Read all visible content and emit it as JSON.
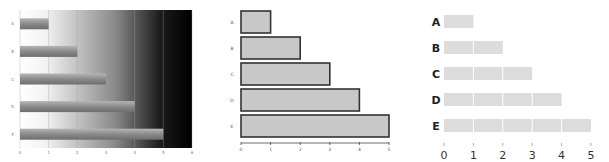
{
  "chart_data": [
    {
      "type": "bar",
      "orientation": "horizontal",
      "style": "gradient-background",
      "categories": [
        "A",
        "B",
        "C",
        "D",
        "E"
      ],
      "values": [
        1,
        2,
        3,
        4,
        5
      ],
      "title": "",
      "xlabel": "",
      "ylabel": "",
      "xlim": [
        0,
        6
      ],
      "xticks": [
        "0",
        "1",
        "2",
        "3",
        "4",
        "5",
        "6"
      ],
      "grid": true,
      "colors": {
        "background_start": "#ffffff",
        "background_end": "#000000",
        "bar": "#8a8a8a"
      }
    },
    {
      "type": "bar",
      "orientation": "horizontal",
      "style": "outlined",
      "categories": [
        "A",
        "B",
        "C",
        "D",
        "E"
      ],
      "values": [
        1,
        2,
        3,
        4,
        5
      ],
      "title": "",
      "xlabel": "",
      "ylabel": "",
      "xlim": [
        0,
        5
      ],
      "xticks": [
        "0",
        "1",
        "2",
        "3",
        "4",
        "5"
      ],
      "grid": false,
      "colors": {
        "bar_fill": "#c8c8c8",
        "bar_stroke": "#333333"
      }
    },
    {
      "type": "bar",
      "orientation": "horizontal",
      "style": "segmented-flat",
      "categories": [
        "A",
        "B",
        "C",
        "D",
        "E"
      ],
      "values": [
        1,
        2,
        3,
        4,
        5
      ],
      "title": "",
      "xlabel": "",
      "ylabel": "",
      "xlim": [
        0,
        5
      ],
      "xticks": [
        "0",
        "1",
        "2",
        "3",
        "4",
        "5"
      ],
      "grid": false,
      "colors": {
        "bar_fill": "#dcdcdc",
        "segment_divider": "#ffffff"
      }
    }
  ]
}
